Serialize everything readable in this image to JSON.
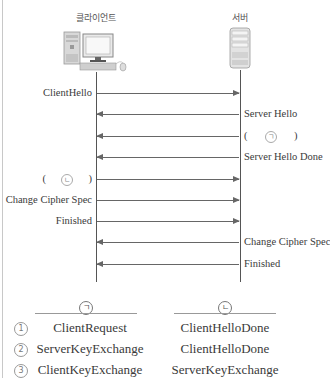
{
  "diagram": {
    "actors": {
      "client": {
        "label": "클라이언트",
        "icon": "desktop-computer-icon"
      },
      "server": {
        "label": "서버",
        "icon": "server-tower-icon"
      }
    },
    "messages": [
      {
        "label": "ClientHello",
        "direction": "client-to-server"
      },
      {
        "label": "Server Hello",
        "direction": "server-to-client"
      },
      {
        "label_open": "(",
        "blank": "ㄱ",
        "label_close": ")",
        "direction": "server-to-client"
      },
      {
        "label": "Server Hello Done",
        "direction": "server-to-client"
      },
      {
        "label_open": "(",
        "blank": "ㄴ",
        "label_close": ")",
        "direction": "client-to-server"
      },
      {
        "label": "Change Cipher Spec",
        "direction": "client-to-server"
      },
      {
        "label": "Finished",
        "direction": "client-to-server"
      },
      {
        "label": "Change Cipher Spec",
        "direction": "server-to-client"
      },
      {
        "label": "Finished",
        "direction": "server-to-client"
      }
    ]
  },
  "answer_table": {
    "headers": [
      "ㄱ",
      "ㄴ"
    ],
    "options": [
      {
        "num": "1",
        "a": "ClientRequest",
        "b": "ClientHelloDone"
      },
      {
        "num": "2",
        "a": "ServerKeyExchange",
        "b": "ClientHelloDone"
      },
      {
        "num": "3",
        "a": "ClientKeyExchange",
        "b": "ServerKeyExchange"
      }
    ]
  }
}
